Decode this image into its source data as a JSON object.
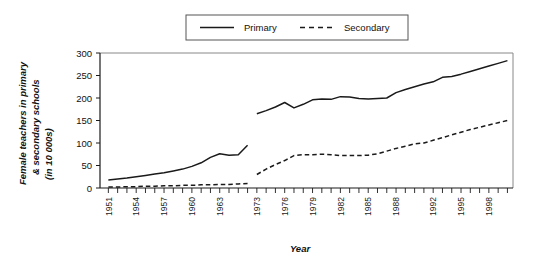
{
  "chart_data": {
    "type": "line",
    "title": "",
    "xlabel": "Year",
    "ylabel": "Female teachers in primary & secondary schools (in 10 000s)",
    "ylabel_line1": "Female teachers in primary",
    "ylabel_line2": "& secondary schools",
    "ylabel_line3": "(in 10 000s)",
    "ylim": [
      0,
      300
    ],
    "yticks": [
      0,
      50,
      100,
      150,
      200,
      250,
      300
    ],
    "ytick_labels": [
      "0",
      "50",
      "100",
      "150",
      "200",
      "250",
      "300"
    ],
    "grid": false,
    "legend_position": "top-center",
    "x_all_ticks": [
      1951,
      1952,
      1953,
      1954,
      1955,
      1956,
      1957,
      1958,
      1959,
      1960,
      1961,
      1962,
      1963,
      1964,
      1965,
      1966,
      1973,
      1974,
      1975,
      1976,
      1977,
      1978,
      1979,
      1980,
      1981,
      1982,
      1983,
      1984,
      1985,
      1986,
      1987,
      1988,
      1989,
      1990,
      1991,
      1992,
      1993,
      1994,
      1995,
      1996,
      1997,
      1998,
      1999,
      2000
    ],
    "xtick_labels_shown": [
      "1951",
      "1954",
      "1957",
      "1960",
      "1963",
      "1973",
      "1976",
      "1979",
      "1982",
      "1985",
      "1988",
      "1992",
      "1995",
      "1998"
    ],
    "series": [
      {
        "name": "Primary",
        "style": "solid",
        "color": "#1a1a1a",
        "segments": [
          {
            "x": [
              1951,
              1952,
              1953,
              1954,
              1955,
              1956,
              1957,
              1958,
              1959,
              1960,
              1961,
              1962,
              1963,
              1964,
              1965,
              1966
            ],
            "values": [
              18,
              20,
              22,
              25,
              28,
              31,
              34,
              38,
              42,
              48,
              56,
              68,
              76,
              73,
              74,
              95
            ]
          },
          {
            "x": [
              1973,
              1974,
              1975,
              1976,
              1977,
              1978,
              1979,
              1980,
              1981,
              1982,
              1983,
              1984,
              1985,
              1986,
              1987,
              1988,
              1989,
              1990,
              1991,
              1992,
              1993,
              1994,
              1995,
              1996,
              1997,
              1998,
              1999,
              2000
            ],
            "values": [
              165,
              172,
              180,
              190,
              178,
              186,
              196,
              198,
              197,
              203,
              202,
              199,
              198,
              199,
              200,
              212,
              219,
              225,
              231,
              236,
              246,
              248,
              253,
              259,
              265,
              271,
              277,
              283
            ]
          }
        ]
      },
      {
        "name": "Secondary",
        "style": "dashed",
        "color": "#1a1a1a",
        "segments": [
          {
            "x": [
              1951,
              1952,
              1953,
              1954,
              1955,
              1956,
              1957,
              1958,
              1959,
              1960,
              1961,
              1962,
              1963,
              1964,
              1965,
              1966
            ],
            "values": [
              2,
              2,
              3,
              3,
              4,
              4,
              5,
              5,
              6,
              6,
              7,
              7,
              8,
              8,
              9,
              10
            ]
          },
          {
            "x": [
              1973,
              1974,
              1975,
              1976,
              1977,
              1978,
              1979,
              1980,
              1981,
              1982,
              1983,
              1984,
              1985,
              1986,
              1987,
              1988,
              1989,
              1990,
              1991,
              1992,
              1993,
              1994,
              1995,
              1996,
              1997,
              1998,
              1999,
              2000
            ],
            "values": [
              30,
              42,
              52,
              61,
              72,
              74,
              74,
              75,
              74,
              72,
              72,
              72,
              73,
              76,
              82,
              88,
              93,
              98,
              100,
              106,
              112,
              118,
              124,
              130,
              135,
              140,
              145,
              150
            ]
          }
        ]
      }
    ]
  },
  "legend": {
    "items": [
      {
        "label": "Primary",
        "style": "solid"
      },
      {
        "label": "Secondary",
        "style": "dashed"
      }
    ]
  },
  "axes": {
    "x_title": "Year",
    "y_title_line1": "Female teachers in primary",
    "y_title_line2": "& secondary schools",
    "y_title_line3": "(in 10 000s)"
  }
}
